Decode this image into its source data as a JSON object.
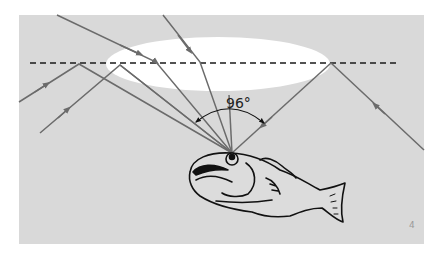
{
  "diagram": {
    "angle_label": "96°",
    "page_marker": "4",
    "colors": {
      "water": "#d9d9d9",
      "window": "#ffffff",
      "ray": "#6b6b6b",
      "surface_line": "#1a1a1a",
      "fish_outline": "#111111",
      "fish_fill": "#dcdcdc"
    },
    "elements": {
      "surface": "dashed water surface line",
      "window": "bright elliptical Snell's window",
      "refracted_rays": "rays from above refracted at surface into fish eye",
      "reflected_rays": "rays from below totally internally reflected at surface into fish eye",
      "angle_arc": "96° cone of vision"
    }
  }
}
